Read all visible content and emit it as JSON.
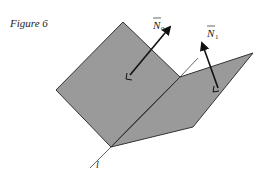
{
  "figure": {
    "caption": "Figure 6",
    "colors": {
      "plane_fill": "#9a9a9a",
      "plane_stroke": "#333333",
      "line_color": "#555555",
      "vector_color": "#111111",
      "background": "#ffffff"
    },
    "planes": [
      {
        "name": "plane-0",
        "vertices": [
          [
            123,
            22
          ],
          [
            180,
            77
          ],
          [
            111,
            147
          ],
          [
            56,
            90
          ]
        ]
      },
      {
        "name": "plane-1",
        "vertices": [
          [
            180,
            77
          ],
          [
            253,
            53
          ],
          [
            193,
            127
          ],
          [
            111,
            147
          ]
        ]
      }
    ],
    "line": {
      "label": "l",
      "from": [
        90,
        168
      ],
      "to": [
        198,
        58
      ]
    },
    "normals": [
      {
        "name": "N0",
        "label_main": "N",
        "label_sub": "0",
        "from": [
          130,
          75
        ],
        "to": [
          170,
          27
        ]
      },
      {
        "name": "N1",
        "label_main": "N",
        "label_sub": "1",
        "from": [
          218,
          87
        ],
        "to": [
          202,
          43
        ]
      }
    ]
  }
}
